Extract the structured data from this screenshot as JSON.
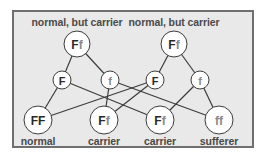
{
  "diagram": {
    "title_hidden": "",
    "colors": {
      "frame_bg": "#e9e9e9",
      "frame_border": "#6f6f6f",
      "node_bg": "#ffffff",
      "line": "#3c3c3c",
      "label": "#4a4a4a"
    },
    "parents": [
      {
        "id": "p1",
        "genotype_dom": "F",
        "genotype_rec": "f",
        "label": "normal, but carrier",
        "x": 77,
        "y": 44
      },
      {
        "id": "p2",
        "genotype_dom": "F",
        "genotype_rec": "f",
        "label": "normal, but carrier",
        "x": 174,
        "y": 44
      }
    ],
    "gametes": [
      {
        "id": "g1",
        "allele": "F",
        "dominant": true,
        "from": "p1",
        "x": 62,
        "y": 80
      },
      {
        "id": "g2",
        "allele": "f",
        "dominant": false,
        "from": "p1",
        "x": 110,
        "y": 80
      },
      {
        "id": "g3",
        "allele": "F",
        "dominant": true,
        "from": "p2",
        "x": 155,
        "y": 80
      },
      {
        "id": "g4",
        "allele": "f",
        "dominant": false,
        "from": "p2",
        "x": 200,
        "y": 80
      }
    ],
    "offspring": [
      {
        "id": "o1",
        "genotype_dom": "FF",
        "genotype_rec": "",
        "label": "normal",
        "x": 38,
        "y": 120
      },
      {
        "id": "o2",
        "genotype_dom": "F",
        "genotype_rec": "f",
        "label": "carrier",
        "x": 104,
        "y": 120
      },
      {
        "id": "o3",
        "genotype_dom": "F",
        "genotype_rec": "f",
        "label": "carrier",
        "x": 160,
        "y": 120
      },
      {
        "id": "o4",
        "genotype_dom": "",
        "genotype_rec": "ff",
        "label": "sufferer",
        "x": 219,
        "y": 120
      }
    ],
    "edges": [
      [
        "p1",
        "g1"
      ],
      [
        "p1",
        "g2"
      ],
      [
        "p2",
        "g3"
      ],
      [
        "p2",
        "g4"
      ],
      [
        "g1",
        "o1"
      ],
      [
        "g1",
        "o3"
      ],
      [
        "g2",
        "o2"
      ],
      [
        "g2",
        "o4"
      ],
      [
        "g3",
        "o1"
      ],
      [
        "g3",
        "o2"
      ],
      [
        "g4",
        "o3"
      ],
      [
        "g4",
        "o4"
      ]
    ]
  }
}
